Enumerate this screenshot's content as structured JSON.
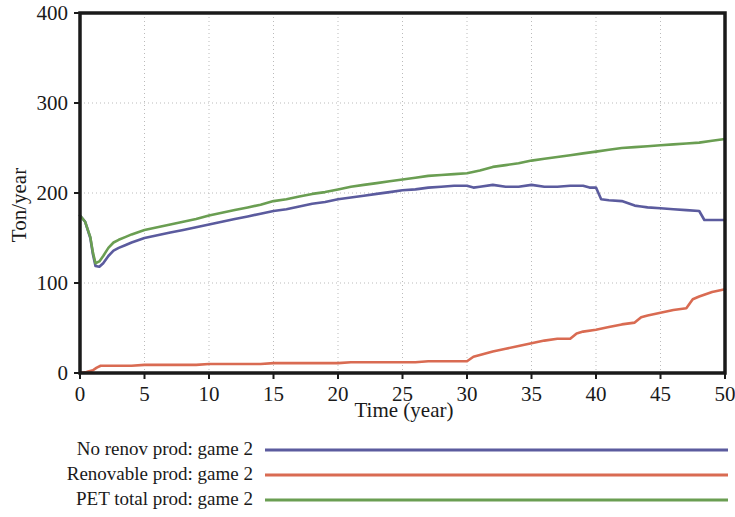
{
  "chart_data": {
    "type": "line",
    "title": "",
    "xlabel": "Time (year)",
    "ylabel": "Ton/year",
    "xlim": [
      0,
      50
    ],
    "ylim": [
      0,
      400
    ],
    "xticks": [
      0,
      5,
      10,
      15,
      20,
      25,
      30,
      35,
      40,
      45,
      50
    ],
    "yticks": [
      0,
      100,
      200,
      300,
      400
    ],
    "grid": true,
    "grid_style": "dotted",
    "legend_position": "below-left",
    "series": [
      {
        "name": "No renov prod: game 2",
        "color": "#5b5b9e",
        "x": [
          0,
          0.4,
          0.8,
          1.0,
          1.2,
          1.5,
          1.8,
          2.2,
          2.6,
          3.0,
          3.5,
          4,
          5,
          6,
          7,
          8,
          9,
          10,
          11,
          12,
          13,
          14,
          15,
          16,
          17,
          18,
          19,
          20,
          21,
          22,
          23,
          24,
          25,
          26,
          27,
          28,
          29,
          30,
          30.5,
          31,
          32,
          33,
          34,
          35,
          36,
          37,
          38,
          39,
          39.5,
          40,
          40.4,
          41,
          42,
          43,
          43.5,
          44,
          45,
          46,
          47,
          48,
          48.4,
          49,
          50
        ],
        "y": [
          175,
          168,
          150,
          132,
          119,
          118,
          122,
          130,
          136,
          139,
          142,
          145,
          150,
          153,
          156,
          159,
          162,
          165,
          168,
          171,
          174,
          177,
          180,
          182,
          185,
          188,
          190,
          193,
          195,
          197,
          199,
          201,
          203,
          204,
          206,
          207,
          208,
          208,
          206,
          207,
          209,
          207,
          207,
          209,
          207,
          207,
          208,
          208,
          206,
          206,
          193,
          192,
          191,
          186,
          185,
          184,
          183,
          182,
          181,
          180,
          170,
          170,
          170
        ]
      },
      {
        "name": "Renovable prod: game 2",
        "color": "#d96b52",
        "x": [
          0,
          0.5,
          1.0,
          1.3,
          1.6,
          2.0,
          3,
          4,
          5,
          6,
          7,
          8,
          9,
          10,
          11,
          12,
          13,
          14,
          15,
          16,
          17,
          18,
          19,
          20,
          21,
          22,
          23,
          24,
          25,
          26,
          27,
          28,
          29,
          30,
          30.5,
          31,
          32,
          33,
          34,
          35,
          36,
          37,
          38,
          38.5,
          39,
          40,
          41,
          42,
          43,
          43.5,
          44,
          45,
          46,
          47,
          47.5,
          48,
          49,
          50
        ],
        "y": [
          0,
          1,
          3,
          6,
          8,
          8,
          8,
          8,
          9,
          9,
          9,
          9,
          9,
          10,
          10,
          10,
          10,
          10,
          11,
          11,
          11,
          11,
          11,
          11,
          12,
          12,
          12,
          12,
          12,
          12,
          13,
          13,
          13,
          13,
          18,
          20,
          24,
          27,
          30,
          33,
          36,
          38,
          38,
          44,
          46,
          48,
          51,
          54,
          56,
          62,
          64,
          67,
          70,
          72,
          82,
          85,
          90,
          93
        ]
      },
      {
        "name": "PET total prod: game 2",
        "color": "#6a9e52",
        "x": [
          0,
          0.4,
          0.8,
          1.0,
          1.2,
          1.5,
          1.8,
          2.2,
          2.6,
          3.0,
          3.5,
          4,
          5,
          6,
          7,
          8,
          9,
          10,
          11,
          12,
          13,
          14,
          15,
          16,
          17,
          18,
          19,
          20,
          21,
          22,
          23,
          24,
          25,
          26,
          27,
          28,
          29,
          30,
          31,
          32,
          33,
          34,
          35,
          36,
          37,
          38,
          39,
          40,
          41,
          42,
          43,
          44,
          45,
          46,
          47,
          48,
          49,
          50
        ],
        "y": [
          175,
          168,
          151,
          134,
          122,
          124,
          130,
          139,
          145,
          148,
          151,
          154,
          159,
          162,
          165,
          168,
          171,
          175,
          178,
          181,
          184,
          187,
          191,
          193,
          196,
          199,
          201,
          204,
          207,
          209,
          211,
          213,
          215,
          217,
          219,
          220,
          221,
          222,
          225,
          229,
          231,
          233,
          236,
          238,
          240,
          242,
          244,
          246,
          248,
          250,
          251,
          252,
          253,
          254,
          255,
          256,
          258,
          260
        ]
      }
    ]
  },
  "axes": {
    "ylabel": "Ton/year",
    "xlabel": "Time (year)",
    "ytick_labels": [
      "400",
      "300",
      "200",
      "100",
      "0"
    ],
    "xtick_labels": [
      "0",
      "5",
      "10",
      "15",
      "20",
      "25",
      "30",
      "35",
      "40",
      "45",
      "50"
    ]
  },
  "legend": {
    "entries": [
      {
        "label": "No renov prod: game 2",
        "color": "#5b5b9e"
      },
      {
        "label": "Renovable prod: game 2",
        "color": "#d96b52"
      },
      {
        "label": "PET total prod: game 2",
        "color": "#6a9e52"
      }
    ]
  },
  "colors": {
    "series_blue": "#5b5b9e",
    "series_red": "#d96b52",
    "series_green": "#6a9e52",
    "axis": "#1a1a1a",
    "grid": "#bbbbbb",
    "background": "#ffffff"
  }
}
